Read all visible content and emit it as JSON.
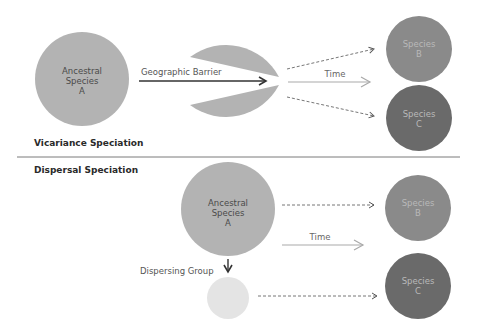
{
  "colors": {
    "ancestral": "#b3b3b3",
    "species_b": "#8a8a8a",
    "species_c": "#6a6a6a",
    "dispersing": "#e4e4e4",
    "arrow_dark": "#333333",
    "arrow_light": "#a9a9a9",
    "divider": "#7a7a7a"
  },
  "vicariance": {
    "title": "Vicariance Speciation",
    "ancestral": {
      "line1": "Ancestral",
      "line2": "Species",
      "line3": "A"
    },
    "barrier_label": "Geographic Barrier",
    "time_label": "Time",
    "species_b": {
      "line1": "Species",
      "line2": "B"
    },
    "species_c": {
      "line1": "Species",
      "line2": "C"
    }
  },
  "dispersal": {
    "title": "Dispersal Speciation",
    "ancestral": {
      "line1": "Ancestral",
      "line2": "Species",
      "line3": "A"
    },
    "dispersing_label": "Dispersing Group",
    "time_label": "Time",
    "species_b": {
      "line1": "Species",
      "line2": "B"
    },
    "species_c": {
      "line1": "Species",
      "line2": "C"
    }
  }
}
